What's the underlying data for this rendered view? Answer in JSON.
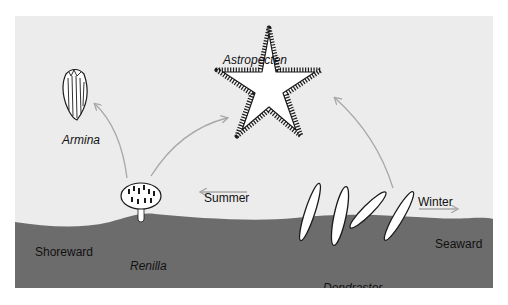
{
  "figure": {
    "colors": {
      "water": "#ececec",
      "sediment": "#6c6c6c",
      "arrow": "#a8a8a8",
      "outline": "#1a1a1a",
      "animal_fill": "#ffffff"
    },
    "organisms": {
      "astropecten": "Astropecten",
      "armina": "Armina",
      "renilla": "Renilla",
      "dendraster": "Dendraster"
    },
    "directions": {
      "summer": "Summer",
      "winter": "Winter",
      "shoreward": "Shoreward",
      "seaward": "Seaward"
    }
  }
}
